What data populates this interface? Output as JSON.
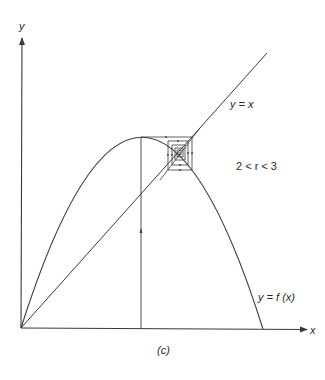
{
  "figure": {
    "caption": "(c)",
    "axes": {
      "x_label": "x",
      "y_label": "y"
    },
    "curves": {
      "diagonal_label": "y = x",
      "map_label": "y = f (x)"
    },
    "parameter_label": "2 < r < 3",
    "colors": {
      "line": "#3a3a3a",
      "text": "#2a2a2a",
      "background": "#ffffff"
    }
  }
}
